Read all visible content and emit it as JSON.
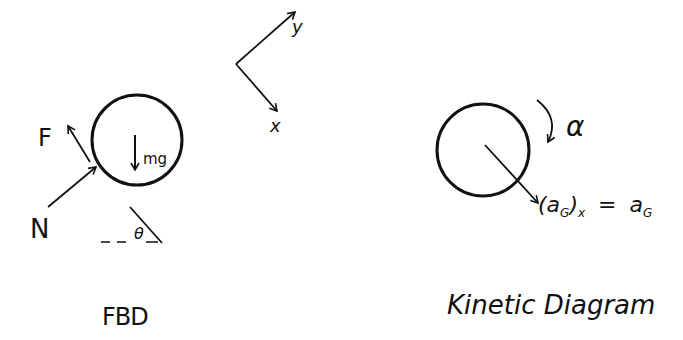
{
  "fbd": {
    "title": "FBD",
    "forces": {
      "friction": "F",
      "normal": "N",
      "weight": "mg"
    },
    "angle_label": "θ"
  },
  "axes": {
    "x_label": "x",
    "y_label": "y"
  },
  "kinetic": {
    "title": "Kinetic Diagram",
    "angular_accel": "α",
    "accel_label": "(a",
    "accel_sub": "G",
    "accel_close": ")",
    "accel_xsub": "x",
    "equals": "=",
    "rhs": "a",
    "rhs_sub": "G"
  },
  "colors": {
    "ink": "#111111",
    "background": "#ffffff"
  }
}
